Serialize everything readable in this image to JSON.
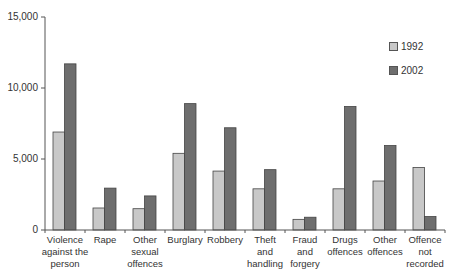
{
  "chart_data": {
    "type": "bar",
    "title": "",
    "xlabel": "",
    "ylabel": "",
    "ylim": [
      0,
      15000
    ],
    "yticks": [
      0,
      5000,
      10000,
      15000
    ],
    "ytick_labels": [
      "0",
      "5,000",
      "10,000",
      "15,000"
    ],
    "grid": false,
    "legend_position": "right",
    "categories": [
      "Violence against the person",
      "Rape",
      "Other sexual offences",
      "Burglary",
      "Robbery",
      "Theft and handling",
      "Fraud and forgery",
      "Drugs offences",
      "Other offences",
      "Offence not recorded"
    ],
    "category_label_lines": [
      [
        "Violence",
        "against the",
        "person"
      ],
      [
        "Rape"
      ],
      [
        "Other",
        "sexual",
        "offences"
      ],
      [
        "Burglary"
      ],
      [
        "Robbery"
      ],
      [
        "Theft",
        "and",
        "handling"
      ],
      [
        "Fraud",
        "and",
        "forgery"
      ],
      [
        "Drugs",
        "offences"
      ],
      [
        "Other",
        "offences"
      ],
      [
        "Offence",
        "not",
        "recorded"
      ]
    ],
    "series": [
      {
        "name": "1992",
        "color": "#c8c8c8",
        "values": [
          6900,
          1550,
          1500,
          5400,
          4150,
          2900,
          750,
          2900,
          3450,
          4400
        ]
      },
      {
        "name": "2002",
        "color": "#6e6e6e",
        "values": [
          11700,
          2950,
          2400,
          8900,
          7200,
          4250,
          900,
          8700,
          5950,
          950
        ]
      }
    ]
  },
  "legend": [
    {
      "label": "1992",
      "color": "#c8c8c8"
    },
    {
      "label": "2002",
      "color": "#6e6e6e"
    }
  ]
}
